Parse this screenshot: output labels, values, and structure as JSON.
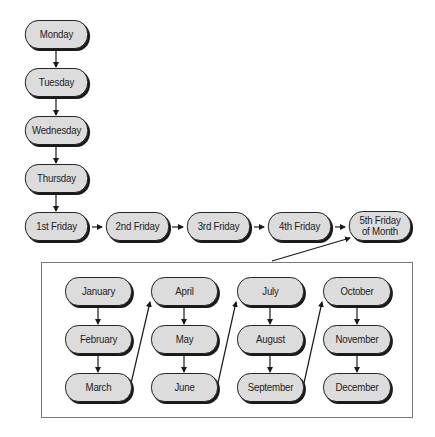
{
  "weekdays": {
    "monday": "Monday",
    "tuesday": "Tuesday",
    "wednesday": "Wednesday",
    "thursday": "Thursday"
  },
  "fridays": {
    "first": "1st Friday",
    "second": "2nd Friday",
    "third": "3rd Friday",
    "fourth": "4th Friday",
    "fifth_line1": "5th Friday",
    "fifth_line2": "of Month"
  },
  "months": {
    "january": "January",
    "february": "February",
    "march": "March",
    "april": "April",
    "may": "May",
    "june": "June",
    "july": "July",
    "august": "August",
    "september": "September",
    "october": "October",
    "november": "November",
    "december": "December"
  },
  "colors": {
    "pill_fill": "#dcdcdc",
    "pill_border": "#1a1a1a",
    "box_border": "#777777"
  }
}
